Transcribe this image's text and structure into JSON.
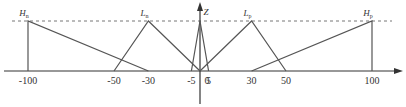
{
  "chart_data": {
    "type": "membership-function-diagram",
    "title": "",
    "xlabel": "",
    "ylabel": "",
    "x_axis": {
      "min": -100,
      "max": 100
    },
    "ticks": [
      {
        "value": -100,
        "label": "-100"
      },
      {
        "value": -50,
        "label": "-50"
      },
      {
        "value": -30,
        "label": "-30"
      },
      {
        "value": -5,
        "label": "-5"
      },
      {
        "value": 0,
        "label": "0"
      },
      {
        "value": 5,
        "label": "5"
      },
      {
        "value": 30,
        "label": "30"
      },
      {
        "value": 50,
        "label": "50"
      },
      {
        "value": 100,
        "label": "100"
      }
    ],
    "sets": [
      {
        "name": "H",
        "sub": "n",
        "points": [
          [
            -100,
            0
          ],
          [
            -100,
            1
          ],
          [
            -30,
            0
          ]
        ]
      },
      {
        "name": "L",
        "sub": "n",
        "points": [
          [
            -50,
            0
          ],
          [
            -30,
            1
          ],
          [
            0,
            0
          ]
        ]
      },
      {
        "name": "Z",
        "sub": "",
        "points": [
          [
            -5,
            0
          ],
          [
            0,
            1
          ],
          [
            5,
            0
          ]
        ]
      },
      {
        "name": "L",
        "sub": "p",
        "points": [
          [
            0,
            0
          ],
          [
            30,
            1
          ],
          [
            50,
            0
          ]
        ]
      },
      {
        "name": "H",
        "sub": "p",
        "points": [
          [
            30,
            0
          ],
          [
            100,
            1
          ],
          [
            100,
            0
          ]
        ]
      }
    ],
    "grid": false,
    "reference_line": {
      "y": 1,
      "style": "dashed"
    },
    "colors": {
      "line": "#555555",
      "axis": "#333333",
      "dashed": "#777777"
    }
  }
}
